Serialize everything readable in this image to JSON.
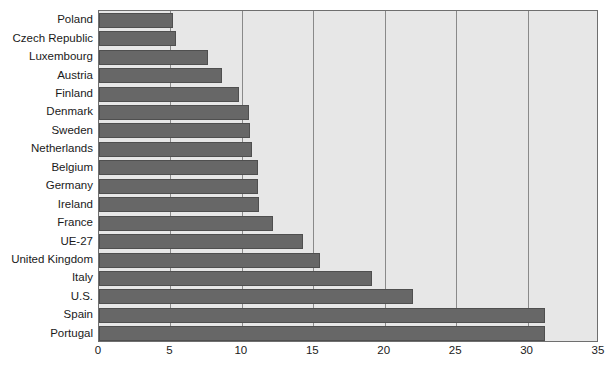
{
  "chart_data": {
    "type": "bar",
    "orientation": "horizontal",
    "title": "",
    "subtitle": "",
    "xlabel": "",
    "ylabel": "",
    "xlim": [
      0,
      35
    ],
    "ylim": null,
    "grid": true,
    "legend": null,
    "legend_position": "none",
    "xticks": [
      0,
      5,
      10,
      15,
      20,
      25,
      30,
      35
    ],
    "xtick_labels": [
      "0",
      "5",
      "10",
      "15",
      "20",
      "25",
      "30",
      "35"
    ],
    "categories": [
      "Poland",
      "Czech Republic",
      "Luxembourg",
      "Austria",
      "Finland",
      "Denmark",
      "Sweden",
      "Netherlands",
      "Belgium",
      "Germany",
      "Ireland",
      "France",
      "UE-27",
      "United Kingdom",
      "Italy",
      "U.S.",
      "Spain",
      "Portugal"
    ],
    "values": [
      5.2,
      5.4,
      7.6,
      8.6,
      9.8,
      10.5,
      10.6,
      10.7,
      11.1,
      11.1,
      11.2,
      12.2,
      14.3,
      15.5,
      19.1,
      22.0,
      31.2,
      31.2
    ],
    "series": [
      {
        "name": "value",
        "values": [
          5.2,
          5.4,
          7.6,
          8.6,
          9.8,
          10.5,
          10.6,
          10.7,
          11.1,
          11.1,
          11.2,
          12.2,
          14.3,
          15.5,
          19.1,
          22.0,
          31.2,
          31.2
        ]
      }
    ],
    "colors": {
      "bar_fill": "#676767",
      "bar_edge": "#4f4f4f",
      "plot_background": "#e7e7e7",
      "plot_border": "#6f6f6f",
      "gridline": "#8a8a8a",
      "text": "#1a1a1a",
      "figure_background": "#ffffff"
    }
  }
}
